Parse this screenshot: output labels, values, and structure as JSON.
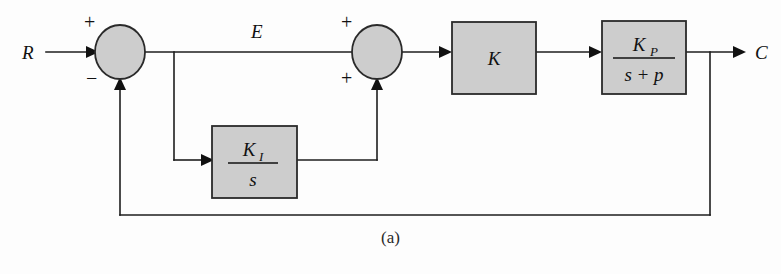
{
  "figure": {
    "caption": "(a)",
    "colors": {
      "block_fill": "#cdcdcd",
      "stroke": "#2a2a2a",
      "wire": "#1e1e1e"
    }
  },
  "signals": {
    "input": "R",
    "error": "E",
    "output": "C"
  },
  "summers": [
    {
      "id": "summing-junction-1",
      "top_sign": "+",
      "bottom_sign": "−",
      "cx": 120,
      "cy": 52,
      "rx": 25,
      "ry": 27
    },
    {
      "id": "summing-junction-2",
      "top_sign": "+",
      "bottom_sign": "+",
      "cx": 377,
      "cy": 52,
      "rx": 25,
      "ry": 27
    }
  ],
  "blocks": [
    {
      "id": "gain-block-k",
      "label": "K",
      "numerator": "K",
      "denominator": "",
      "fraction": false,
      "x": 452,
      "y": 22,
      "w": 84,
      "h": 72
    },
    {
      "id": "plant-block-kp",
      "label": "K_P / (s + p)",
      "numerator": "K",
      "numerator_sub": "P",
      "denominator": "s + p",
      "fraction": true,
      "x": 602,
      "y": 21,
      "w": 84,
      "h": 73
    },
    {
      "id": "integrator-block-ki",
      "label": "K_I / s",
      "numerator": "K",
      "numerator_sub": "I",
      "denominator": "s",
      "fraction": true,
      "x": 212,
      "y": 126,
      "w": 85,
      "h": 72
    }
  ]
}
